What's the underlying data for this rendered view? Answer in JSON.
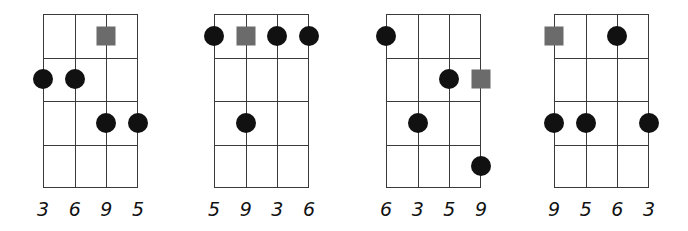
{
  "diagram": {
    "type": "chord-diagram-set",
    "strings_per_chord": 4,
    "frets_shown": 4,
    "colors": {
      "grid": "#3a3a3a",
      "note_dot": "#111111",
      "root_square": "#6b6b6b",
      "background": "#ffffff"
    },
    "chords": [
      {
        "labels": [
          "3",
          "6",
          "9",
          "5"
        ],
        "markers": [
          {
            "string": 3,
            "fret": 1,
            "type": "root"
          },
          {
            "string": 1,
            "fret": 2,
            "type": "note"
          },
          {
            "string": 2,
            "fret": 2,
            "type": "note"
          },
          {
            "string": 3,
            "fret": 3,
            "type": "note"
          },
          {
            "string": 4,
            "fret": 3,
            "type": "note"
          }
        ]
      },
      {
        "labels": [
          "5",
          "9",
          "3",
          "6"
        ],
        "markers": [
          {
            "string": 1,
            "fret": 1,
            "type": "note"
          },
          {
            "string": 2,
            "fret": 1,
            "type": "root"
          },
          {
            "string": 3,
            "fret": 1,
            "type": "note"
          },
          {
            "string": 4,
            "fret": 1,
            "type": "note"
          },
          {
            "string": 2,
            "fret": 3,
            "type": "note"
          }
        ]
      },
      {
        "labels": [
          "6",
          "3",
          "5",
          "9"
        ],
        "markers": [
          {
            "string": 1,
            "fret": 1,
            "type": "note"
          },
          {
            "string": 3,
            "fret": 2,
            "type": "note"
          },
          {
            "string": 4,
            "fret": 2,
            "type": "root"
          },
          {
            "string": 2,
            "fret": 3,
            "type": "note"
          },
          {
            "string": 4,
            "fret": 4,
            "type": "note"
          }
        ]
      },
      {
        "labels": [
          "9",
          "5",
          "6",
          "3"
        ],
        "markers": [
          {
            "string": 1,
            "fret": 1,
            "type": "root"
          },
          {
            "string": 3,
            "fret": 1,
            "type": "note"
          },
          {
            "string": 1,
            "fret": 3,
            "type": "note"
          },
          {
            "string": 2,
            "fret": 3,
            "type": "note"
          },
          {
            "string": 4,
            "fret": 3,
            "type": "note"
          }
        ]
      }
    ]
  }
}
